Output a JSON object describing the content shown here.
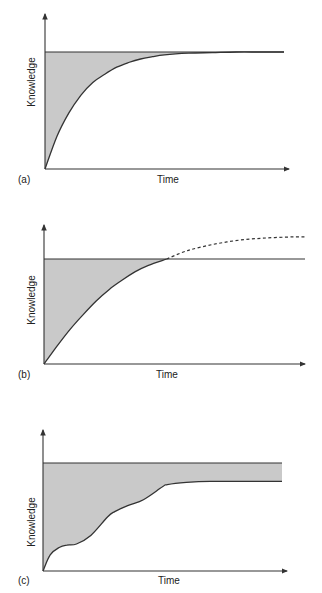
{
  "figure": {
    "fill_color": "#c9c9c9",
    "line_color": "#333333",
    "panels": [
      {
        "id": "a",
        "tag": "(a)",
        "xlabel": "Time",
        "ylabel": "Knowledge",
        "description": "Knowledge rises exponentially and converges to the required level; shaded gap shrinks to zero"
      },
      {
        "id": "b",
        "tag": "(b)",
        "xlabel": "Time",
        "ylabel": "Knowledge",
        "description": "Knowledge rises and meets required level; dashed continuation beyond the level"
      },
      {
        "id": "c",
        "tag": "(c)",
        "xlabel": "Time",
        "ylabel": "Knowledge",
        "description": "Knowledge rises in steps and plateaus below required level; persistent shaded gap"
      }
    ]
  },
  "chart_data": [
    {
      "type": "area",
      "panel": "a",
      "title": "",
      "xlabel": "Time",
      "ylabel": "Knowledge",
      "xlim": [
        0,
        1
      ],
      "ylim": [
        0,
        1.15
      ],
      "grid": false,
      "required_level": 1.0,
      "series": [
        {
          "name": "knowledge",
          "style": "solid",
          "x": [
            0,
            0.05,
            0.1,
            0.15,
            0.2,
            0.25,
            0.3,
            0.35,
            0.4,
            0.45,
            0.5,
            0.6,
            0.7,
            0.8,
            0.9,
            1.0
          ],
          "y": [
            0,
            0.28,
            0.48,
            0.63,
            0.74,
            0.81,
            0.87,
            0.91,
            0.94,
            0.96,
            0.975,
            0.99,
            0.995,
            1.0,
            1.0,
            1.0
          ]
        }
      ],
      "shaded_region": "between required level and knowledge curve"
    },
    {
      "type": "area",
      "panel": "b",
      "title": "",
      "xlabel": "Time",
      "ylabel": "Knowledge",
      "xlim": [
        0,
        1
      ],
      "ylim": [
        0,
        1.35
      ],
      "grid": false,
      "required_level": 1.0,
      "series": [
        {
          "name": "knowledge",
          "style": "solid",
          "x": [
            0,
            0.05,
            0.1,
            0.15,
            0.2,
            0.25,
            0.3,
            0.35,
            0.4,
            0.47
          ],
          "y": [
            0,
            0.17,
            0.33,
            0.47,
            0.6,
            0.71,
            0.8,
            0.88,
            0.94,
            1.0
          ]
        },
        {
          "name": "knowledge-continued",
          "style": "dashed",
          "x": [
            0.47,
            0.55,
            0.65,
            0.75,
            0.85,
            0.95,
            1.0
          ],
          "y": [
            1.0,
            1.08,
            1.14,
            1.18,
            1.2,
            1.21,
            1.21
          ]
        }
      ],
      "shaded_region": "between required level and knowledge curve up to intersection"
    },
    {
      "type": "area",
      "panel": "c",
      "title": "",
      "xlabel": "Time",
      "ylabel": "Knowledge",
      "xlim": [
        0,
        1
      ],
      "ylim": [
        0,
        1.25
      ],
      "grid": false,
      "required_level": 1.0,
      "series": [
        {
          "name": "knowledge",
          "style": "solid",
          "x": [
            0,
            0.03,
            0.07,
            0.1,
            0.14,
            0.2,
            0.27,
            0.3,
            0.36,
            0.42,
            0.5,
            0.52,
            0.6,
            0.7,
            0.8,
            0.9,
            1.0
          ],
          "y": [
            0,
            0.15,
            0.22,
            0.24,
            0.25,
            0.33,
            0.5,
            0.55,
            0.61,
            0.66,
            0.78,
            0.8,
            0.82,
            0.83,
            0.83,
            0.83,
            0.83
          ]
        }
      ],
      "shaded_region": "between required level and knowledge curve (persistent gap)"
    }
  ]
}
